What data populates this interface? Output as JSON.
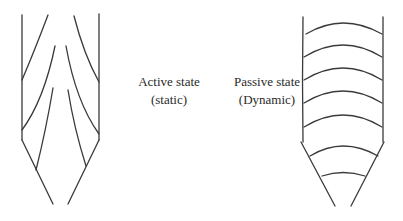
{
  "diagram": {
    "stroke_color": "#3a3a3a",
    "background": "#ffffff",
    "active": {
      "title": "Active state",
      "subtitle": "(static)"
    },
    "passive": {
      "title": "Passive state",
      "subtitle": "(Dynamic)"
    }
  }
}
